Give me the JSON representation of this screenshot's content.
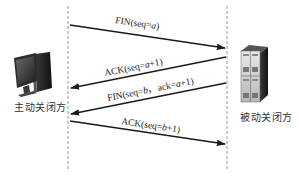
{
  "diagram": {
    "parties": {
      "active": {
        "label": "主动关闭方",
        "icon": "desktop-computer-icon"
      },
      "passive": {
        "label": "被动关闭方",
        "icon": "server-tower-icon"
      }
    },
    "messages": [
      {
        "id": "fin1",
        "direction": "active-to-passive",
        "parts": [
          {
            "text": "FIN(seq=",
            "italic": false
          },
          {
            "text": "a",
            "italic": true
          },
          {
            "text": ")",
            "italic": false
          }
        ]
      },
      {
        "id": "ack1",
        "direction": "passive-to-active",
        "parts": [
          {
            "text": "ACK(seq=",
            "italic": false
          },
          {
            "text": "a",
            "italic": true
          },
          {
            "text": "+1)",
            "italic": false
          }
        ]
      },
      {
        "id": "fin2",
        "direction": "passive-to-active",
        "parts": [
          {
            "text": "FIN(seq=",
            "italic": false
          },
          {
            "text": "b",
            "italic": true
          },
          {
            "text": "，ack=",
            "italic": false
          },
          {
            "text": "a",
            "italic": true
          },
          {
            "text": "+1)",
            "italic": false
          }
        ]
      },
      {
        "id": "ack2",
        "direction": "active-to-passive",
        "parts": [
          {
            "text": "ACK(seq=",
            "italic": false
          },
          {
            "text": "b",
            "italic": true
          },
          {
            "text": "+1)",
            "italic": false
          }
        ]
      }
    ],
    "colors": {
      "arrow": "#1a1a1a",
      "lifeline": "#888888",
      "text": "#222222"
    }
  }
}
